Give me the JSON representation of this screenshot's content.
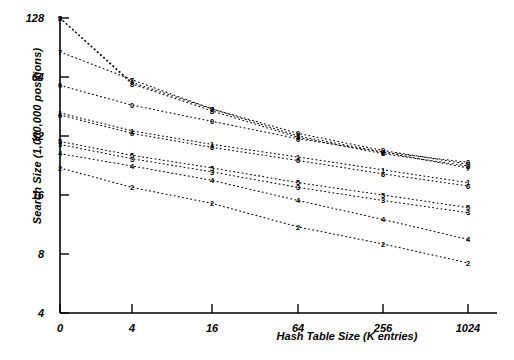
{
  "chart_data": {
    "type": "line",
    "title": "",
    "xlabel": "Hash Table Size (K entries)",
    "ylabel": "Search Size (1,000,000 positions)",
    "xticks": [
      "0",
      "4",
      "16",
      "64",
      "256",
      "1024"
    ],
    "xtick_values": [
      0,
      4,
      16,
      64,
      256,
      1024
    ],
    "yticks": [
      "128",
      "64",
      "32",
      "16",
      "8",
      "4"
    ],
    "ytick_values": [
      128,
      64,
      32,
      16,
      8,
      4
    ],
    "xscale": "log-with-zero-origin",
    "yscale": "log2",
    "xlim": [
      0,
      1024
    ],
    "ylim": [
      4,
      128
    ],
    "grid": false,
    "legend": "point-markers-are-series-digit-labels",
    "marker_style": "digit",
    "line_style": "dotted",
    "series": [
      {
        "name": "9",
        "label": "9",
        "x": [
          0,
          4,
          16,
          64,
          256,
          1024
        ],
        "values": [
          128,
          60.0,
          44.0,
          33.0,
          27.0,
          23.0
        ]
      },
      {
        "name": "7",
        "label": "7",
        "x": [
          0,
          4,
          16,
          64,
          256,
          1024
        ],
        "values": [
          86.0,
          62.0,
          44.0,
          32.0,
          26.5,
          22.0
        ]
      },
      {
        "name": "8",
        "label": "8",
        "x": [
          0,
          4,
          16,
          64,
          256,
          1024
        ],
        "values": [
          128,
          59.0,
          43.0,
          31.5,
          26.0,
          22.5
        ]
      },
      {
        "name": "0",
        "label": "0",
        "x": [
          0,
          4,
          16,
          64,
          256,
          1024
        ],
        "values": [
          58.0,
          46.0,
          38.0,
          31.0,
          26.5,
          23.5
        ]
      },
      {
        "name": "1",
        "label": "1",
        "x": [
          0,
          4,
          16,
          64,
          256,
          1024
        ],
        "values": [
          42.0,
          34.0,
          29.0,
          25.0,
          21.5,
          18.5
        ]
      },
      {
        "name": "6",
        "label": "6",
        "x": [
          0,
          4,
          16,
          64,
          256,
          1024
        ],
        "values": [
          41.0,
          33.0,
          28.0,
          24.0,
          20.5,
          17.8
        ]
      },
      {
        "name": "5",
        "label": "5",
        "x": [
          0,
          4,
          16,
          64,
          256,
          1024
        ],
        "values": [
          30.0,
          25.5,
          22.0,
          18.5,
          16.0,
          13.8
        ]
      },
      {
        "name": "3",
        "label": "3",
        "x": [
          0,
          4,
          16,
          64,
          256,
          1024
        ],
        "values": [
          29.0,
          24.5,
          21.0,
          17.5,
          15.0,
          13.0
        ]
      },
      {
        "name": "4",
        "label": "4",
        "x": [
          0,
          4,
          16,
          64,
          256,
          1024
        ],
        "values": [
          26.0,
          22.5,
          19.0,
          15.0,
          12.0,
          9.5
        ]
      },
      {
        "name": "2",
        "label": "2",
        "x": [
          0,
          4,
          16,
          64,
          256,
          1024
        ],
        "values": [
          22.0,
          17.5,
          14.5,
          11.0,
          9.0,
          7.2
        ]
      }
    ],
    "point_labels_by_column": {
      "x0": [
        "9",
        "8",
        "7",
        "0",
        "1",
        "6",
        "5",
        "3",
        "4",
        "2"
      ],
      "x4": [
        "7",
        "1",
        "5",
        "9",
        "0",
        "4",
        "8"
      ],
      "x16": [
        "8",
        "9",
        "0",
        "1",
        "6",
        "5",
        "3",
        "0",
        "4",
        "8"
      ],
      "x64": [
        "3",
        "1",
        "8",
        "7",
        "6",
        "5",
        "9",
        "0",
        "4",
        "2",
        "8"
      ],
      "x256": [
        "8",
        "7",
        "1",
        "6",
        "5",
        "9",
        "8",
        "4",
        "8"
      ],
      "x1024": [
        "0",
        "8",
        "7",
        "1",
        "6",
        "5",
        "9",
        "4",
        "2"
      ]
    }
  }
}
